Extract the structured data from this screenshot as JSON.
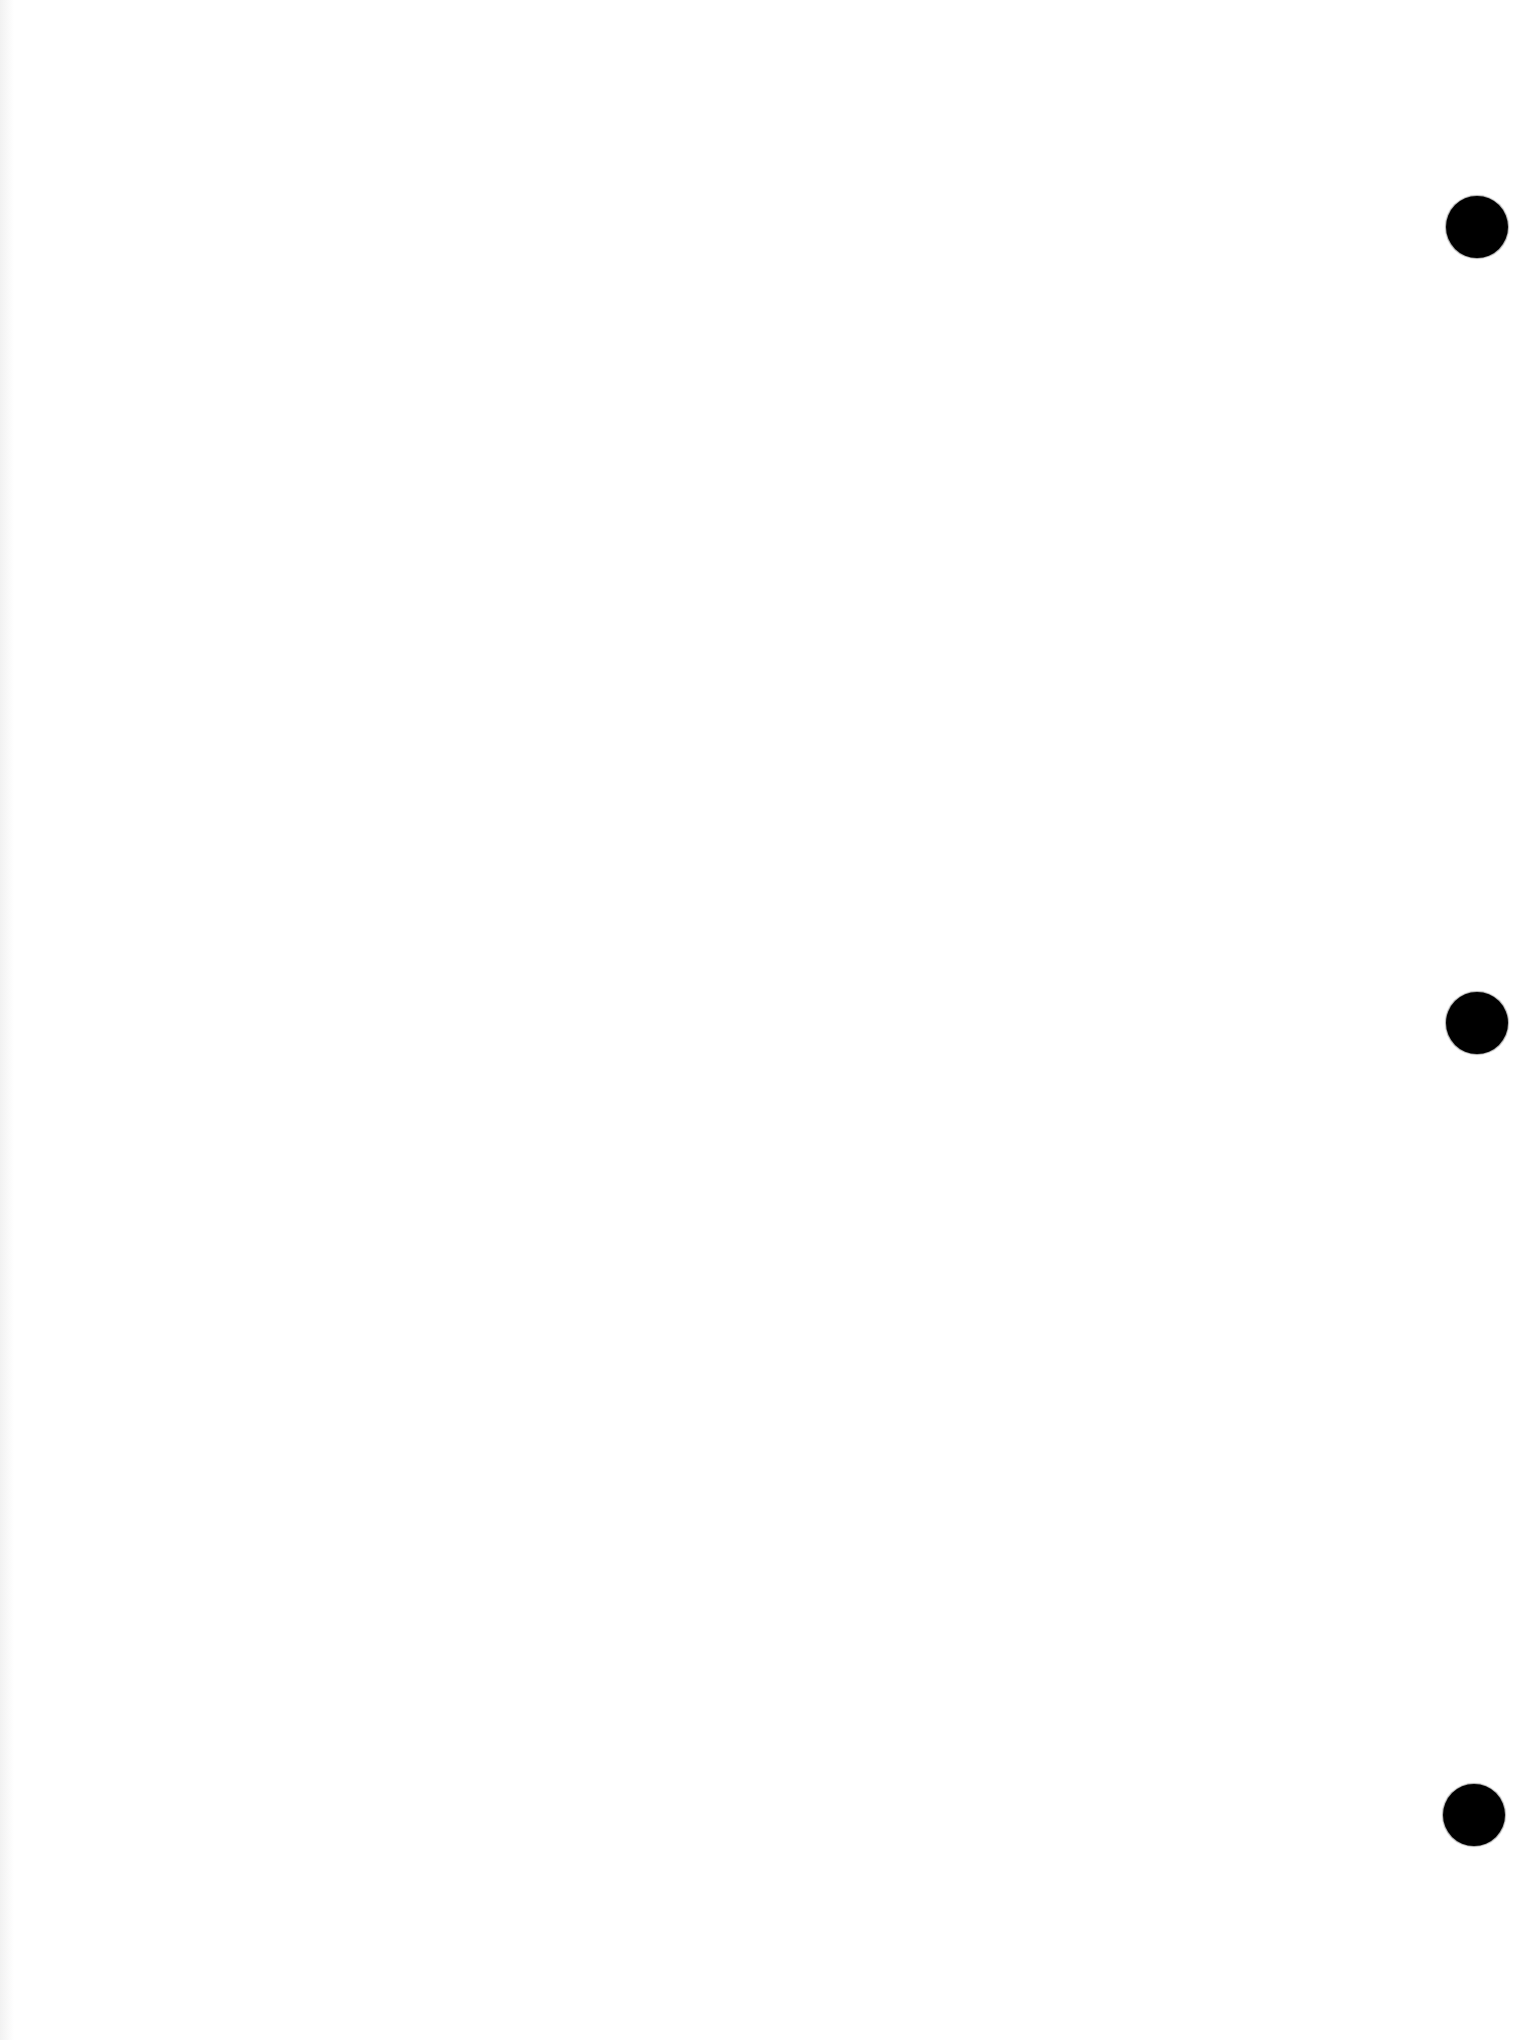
{
  "document": {
    "type": "blank-scanned-page",
    "background_color": "#ffffff",
    "text_content": "",
    "hole_punches": [
      {
        "cx": 1477,
        "cy": 227,
        "diameter": 62,
        "color": "#000000"
      },
      {
        "cx": 1477,
        "cy": 1023,
        "diameter": 62,
        "color": "#000000"
      },
      {
        "cx": 1474,
        "cy": 1815,
        "diameter": 62,
        "color": "#000000"
      }
    ]
  }
}
